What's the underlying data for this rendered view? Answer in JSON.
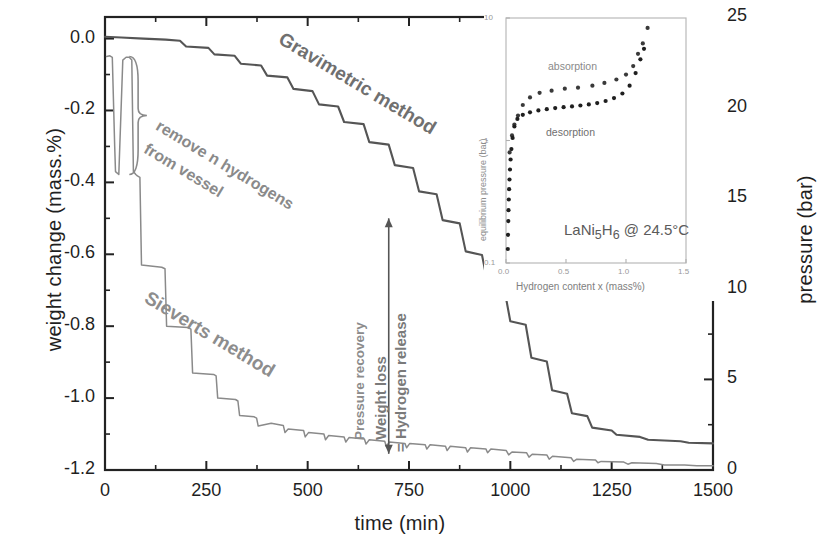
{
  "chart_data": {
    "type": "line",
    "title": "",
    "xlabel": "time (min)",
    "ylabel": "weight change (mass.%)",
    "y2label": "pressure (bar)",
    "xlim": [
      0,
      1500
    ],
    "ylim": [
      -1.2,
      0.06
    ],
    "y2lim": [
      0,
      25
    ],
    "xticks": [
      0,
      250,
      500,
      750,
      1000,
      1250,
      1500
    ],
    "xtick_labels": [
      "0",
      "250",
      "500",
      "750",
      "1000",
      "1250",
      "1500"
    ],
    "yticks": [
      0.0,
      -0.2,
      -0.4,
      -0.6,
      -0.8,
      -1.0,
      -1.2
    ],
    "ytick_labels": [
      "0.0",
      "-0.2",
      "-0.4",
      "-0.6",
      "-0.8",
      "-1.0",
      "-1.2"
    ],
    "y2ticks": [
      0,
      5,
      10,
      15,
      20,
      25
    ],
    "y2tick_labels": [
      "0",
      "5",
      "10",
      "15",
      "20",
      "25"
    ],
    "y_minor_ticks": [
      -0.1,
      -0.3,
      -0.5,
      -0.7,
      -0.9,
      -1.1
    ],
    "x_minor_ticks": [
      125,
      375,
      625,
      875,
      1125,
      1375
    ],
    "y2_minor_ticks": [
      2.5,
      7.5,
      12.5,
      17.5,
      22.5
    ],
    "grid": false,
    "legend": "none",
    "series": [
      {
        "name": "Gravimetric method",
        "axis": "left",
        "color": "#555555",
        "points": [
          [
            0,
            0.005
          ],
          [
            40,
            0.003
          ],
          [
            95,
            0.0
          ],
          [
            150,
            -0.003
          ],
          [
            185,
            -0.006
          ],
          [
            200,
            -0.022
          ],
          [
            255,
            -0.026
          ],
          [
            270,
            -0.044
          ],
          [
            320,
            -0.048
          ],
          [
            335,
            -0.07
          ],
          [
            385,
            -0.075
          ],
          [
            400,
            -0.103
          ],
          [
            450,
            -0.108
          ],
          [
            465,
            -0.14
          ],
          [
            512,
            -0.146
          ],
          [
            528,
            -0.183
          ],
          [
            575,
            -0.189
          ],
          [
            590,
            -0.232
          ],
          [
            638,
            -0.238
          ],
          [
            652,
            -0.288
          ],
          [
            700,
            -0.295
          ],
          [
            715,
            -0.352
          ],
          [
            760,
            -0.36
          ],
          [
            775,
            -0.425
          ],
          [
            818,
            -0.433
          ],
          [
            833,
            -0.505
          ],
          [
            875,
            -0.514
          ],
          [
            890,
            -0.592
          ],
          [
            930,
            -0.602
          ],
          [
            945,
            -0.686
          ],
          [
            985,
            -0.696
          ],
          [
            1000,
            -0.786
          ],
          [
            1038,
            -0.796
          ],
          [
            1052,
            -0.888
          ],
          [
            1090,
            -0.898
          ],
          [
            1103,
            -0.978
          ],
          [
            1140,
            -0.988
          ],
          [
            1152,
            -1.042
          ],
          [
            1190,
            -1.05
          ],
          [
            1202,
            -1.082
          ],
          [
            1250,
            -1.09
          ],
          [
            1262,
            -1.102
          ],
          [
            1320,
            -1.108
          ],
          [
            1340,
            -1.116
          ],
          [
            1420,
            -1.12
          ],
          [
            1440,
            -1.124
          ],
          [
            1500,
            -1.126
          ]
        ]
      },
      {
        "name": "Sieverts method",
        "axis": "left",
        "color": "#8a8a8a",
        "points": [
          [
            4,
            -0.05
          ],
          [
            12,
            -0.048
          ],
          [
            18,
            -0.052
          ],
          [
            24,
            -0.3
          ],
          [
            26,
            -0.37
          ],
          [
            34,
            -0.378
          ],
          [
            44,
            -0.06
          ],
          [
            52,
            -0.052
          ],
          [
            60,
            -0.052
          ],
          [
            66,
            -0.06
          ],
          [
            70,
            -0.37
          ],
          [
            76,
            -0.378
          ],
          [
            80,
            -0.382
          ],
          [
            86,
            -0.386
          ],
          [
            90,
            -0.63
          ],
          [
            140,
            -0.636
          ],
          [
            148,
            -0.64
          ],
          [
            152,
            -0.8
          ],
          [
            205,
            -0.804
          ],
          [
            212,
            -0.808
          ],
          [
            216,
            -0.93
          ],
          [
            268,
            -0.934
          ],
          [
            274,
            -0.938
          ],
          [
            278,
            -1.0
          ],
          [
            322,
            -1.004
          ],
          [
            328,
            -1.008
          ],
          [
            332,
            -1.048
          ],
          [
            368,
            -1.052
          ],
          [
            374,
            -1.056
          ],
          [
            378,
            -1.078
          ],
          [
            410,
            -1.07
          ],
          [
            440,
            -1.076
          ],
          [
            444,
            -1.096
          ],
          [
            452,
            -1.086
          ],
          [
            490,
            -1.09
          ],
          [
            494,
            -1.108
          ],
          [
            502,
            -1.096
          ],
          [
            540,
            -1.1
          ],
          [
            544,
            -1.116
          ],
          [
            552,
            -1.104
          ],
          [
            590,
            -1.108
          ],
          [
            594,
            -1.122
          ],
          [
            602,
            -1.11
          ],
          [
            640,
            -1.114
          ],
          [
            644,
            -1.128
          ],
          [
            652,
            -1.116
          ],
          [
            690,
            -1.12
          ],
          [
            694,
            -1.134
          ],
          [
            702,
            -1.122
          ],
          [
            740,
            -1.126
          ],
          [
            744,
            -1.138
          ],
          [
            752,
            -1.126
          ],
          [
            790,
            -1.13
          ],
          [
            794,
            -1.142
          ],
          [
            802,
            -1.13
          ],
          [
            840,
            -1.134
          ],
          [
            844,
            -1.146
          ],
          [
            852,
            -1.134
          ],
          [
            890,
            -1.138
          ],
          [
            894,
            -1.15
          ],
          [
            902,
            -1.138
          ],
          [
            940,
            -1.142
          ],
          [
            944,
            -1.152
          ],
          [
            952,
            -1.142
          ],
          [
            990,
            -1.146
          ],
          [
            996,
            -1.158
          ],
          [
            1004,
            -1.15
          ],
          [
            1040,
            -1.152
          ],
          [
            1046,
            -1.164
          ],
          [
            1054,
            -1.156
          ],
          [
            1090,
            -1.158
          ],
          [
            1096,
            -1.17
          ],
          [
            1104,
            -1.162
          ],
          [
            1150,
            -1.166
          ],
          [
            1156,
            -1.176
          ],
          [
            1164,
            -1.17
          ],
          [
            1210,
            -1.172
          ],
          [
            1216,
            -1.18
          ],
          [
            1224,
            -1.176
          ],
          [
            1280,
            -1.178
          ],
          [
            1290,
            -1.184
          ],
          [
            1300,
            -1.18
          ],
          [
            1360,
            -1.182
          ],
          [
            1380,
            -1.186
          ],
          [
            1430,
            -1.186
          ],
          [
            1460,
            -1.188
          ],
          [
            1500,
            -1.188
          ]
        ]
      }
    ],
    "curve_labels": [
      {
        "name": "Gravimetric method",
        "text": "Gravimetric method"
      },
      {
        "name": "Sieverts method",
        "text": "Sieverts method"
      }
    ],
    "annotations": [
      {
        "name": "remove-hydrogens",
        "line1": "remove n hydrogens",
        "line2": "from vessel"
      },
      {
        "name": "pressure-recovery",
        "text": "Pressure recovery"
      },
      {
        "name": "weight-loss",
        "text": "Weight loss"
      },
      {
        "name": "hydrogen-release",
        "text": "= Hydrogen release"
      }
    ]
  },
  "inset": {
    "type": "scatter",
    "title": "",
    "xlabel": "Hydrogen content x (mass%)",
    "ylabel": "equilibrium pressure (bar)",
    "sample_label": "LaNi",
    "sample_sub1": "5",
    "sample_label2": "H",
    "sample_sub2": "6",
    "sample_cond": "@ 24.5°C",
    "xlim": [
      0,
      1.5
    ],
    "ylim": [
      0.1,
      10
    ],
    "yscale": "log",
    "xticks": [
      0.0,
      0.5,
      1.0,
      1.5
    ],
    "xtick_labels": [
      "0.0",
      "0.5",
      "1.0",
      "1.5"
    ],
    "yticks": [
      0.1,
      1,
      10
    ],
    "ytick_labels": [
      "0.1",
      "1",
      "10"
    ],
    "series": [
      {
        "name": "absorption",
        "label": "absorption",
        "color": "#3a3a3a",
        "points": [
          [
            0.03,
            0.8
          ],
          [
            0.05,
            1.1
          ],
          [
            0.07,
            1.35
          ],
          [
            0.1,
            1.6
          ],
          [
            0.14,
            1.95
          ],
          [
            0.2,
            2.25
          ],
          [
            0.28,
            2.45
          ],
          [
            0.38,
            2.55
          ],
          [
            0.49,
            2.65
          ],
          [
            0.6,
            2.7
          ],
          [
            0.72,
            2.8
          ],
          [
            0.82,
            2.95
          ],
          [
            0.92,
            3.15
          ],
          [
            1.0,
            3.45
          ],
          [
            1.06,
            4.05
          ],
          [
            1.1,
            5.1
          ],
          [
            1.14,
            6.2
          ],
          [
            1.18,
            8.3
          ]
        ]
      },
      {
        "name": "desorption",
        "label": "desorption",
        "color": "#1f1f1f",
        "points": [
          [
            0.015,
            0.13
          ],
          [
            0.017,
            0.17
          ],
          [
            0.019,
            0.22
          ],
          [
            0.021,
            0.27
          ],
          [
            0.023,
            0.33
          ],
          [
            0.026,
            0.4
          ],
          [
            0.029,
            0.48
          ],
          [
            0.033,
            0.58
          ],
          [
            0.038,
            0.7
          ],
          [
            0.045,
            0.85
          ],
          [
            0.055,
            1.05
          ],
          [
            0.07,
            1.3
          ],
          [
            0.095,
            1.5
          ],
          [
            0.14,
            1.62
          ],
          [
            0.2,
            1.7
          ],
          [
            0.27,
            1.76
          ],
          [
            0.34,
            1.8
          ],
          [
            0.41,
            1.84
          ],
          [
            0.48,
            1.87
          ],
          [
            0.55,
            1.9
          ],
          [
            0.62,
            1.93
          ],
          [
            0.69,
            1.97
          ],
          [
            0.76,
            2.02
          ],
          [
            0.83,
            2.1
          ],
          [
            0.9,
            2.22
          ],
          [
            0.97,
            2.42
          ],
          [
            1.03,
            2.8
          ],
          [
            1.08,
            3.55
          ],
          [
            1.12,
            4.6
          ],
          [
            1.15,
            5.6
          ]
        ]
      }
    ]
  }
}
